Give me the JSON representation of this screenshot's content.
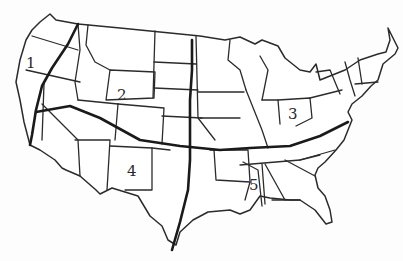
{
  "map": {
    "subject": "Contiguous United States outline map",
    "style": "hand-drawn black line art on white",
    "colors": {
      "background": "#fdfdfd",
      "line": "#2b2b2b",
      "divider": "#1a1a1a"
    },
    "dividers": [
      {
        "id": "west-ns-line",
        "orientation": "north-south"
      },
      {
        "id": "central-ns-line",
        "orientation": "north-south"
      },
      {
        "id": "east-west-line",
        "orientation": "east-west"
      }
    ],
    "region_labels": [
      {
        "id": 1,
        "text": "1",
        "location": "Pacific Northwest (Oregon coast)"
      },
      {
        "id": 2,
        "text": "2",
        "location": "Wyoming"
      },
      {
        "id": 3,
        "text": "3",
        "location": "Ohio"
      },
      {
        "id": 4,
        "text": "4",
        "location": "New Mexico"
      },
      {
        "id": 5,
        "text": "5",
        "location": "Mississippi"
      }
    ]
  }
}
